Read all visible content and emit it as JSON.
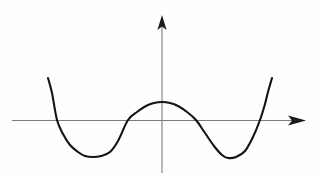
{
  "figure": {
    "title": "",
    "background_color": "#fefefe",
    "width": 320,
    "height": 177
  },
  "axes": {
    "x_axis": {
      "name": "x-axis",
      "color": "#7c7c7c",
      "y_pixel": 120.5,
      "x_start": 12,
      "x_end": 306,
      "arrow": "right",
      "label": "",
      "ticks": [],
      "tick_labels": []
    },
    "y_axis": {
      "name": "y-axis",
      "color": "#7c7c7c",
      "x_pixel": 162,
      "y_start": 173,
      "y_end": 15,
      "arrow": "up",
      "label": "",
      "ticks": [],
      "tick_labels": []
    },
    "origin": {
      "x": 162,
      "y": 120.5
    }
  },
  "chart_data": {
    "type": "line",
    "title": "",
    "xlabel": "",
    "ylabel": "",
    "grid": false,
    "legend": null,
    "series": [
      {
        "name": "quartic-curve",
        "color": "#141414",
        "linewidth": 2.1,
        "description": "W-shaped quartic (double-well) curve with two minima below the x-axis and a local maximum above the origin",
        "x": [
          48,
          52,
          57,
          63,
          70,
          78,
          85,
          93,
          101,
          110,
          118,
          128,
          137,
          146,
          154,
          162,
          170,
          178,
          187,
          196,
          205,
          214,
          222,
          228,
          236,
          245,
          253,
          260,
          265,
          268,
          272
        ],
        "y": [
          78,
          93,
          120,
          134,
          145,
          152,
          156,
          157,
          156,
          152,
          141,
          120,
          112,
          106,
          103,
          102,
          103,
          106,
          112,
          120,
          133,
          146,
          155,
          158,
          157,
          151,
          137,
          120,
          104,
          92,
          78
        ]
      }
    ],
    "features": {
      "left_endpoint": {
        "x": 48,
        "y": 78
      },
      "left_minimum": {
        "x": 93,
        "y": 157
      },
      "local_maximum": {
        "x": 162,
        "y": 102
      },
      "right_minimum": {
        "x": 228,
        "y": 158
      },
      "right_endpoint": {
        "x": 272,
        "y": 78
      },
      "x_intercepts": [
        57,
        128,
        196,
        264
      ]
    },
    "xlim": [
      12,
      306
    ],
    "ylim": [
      173,
      15
    ]
  }
}
